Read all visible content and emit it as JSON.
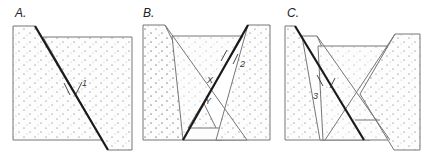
{
  "panels": [
    {
      "id": "A",
      "label": "A.",
      "slip_marker": "1",
      "markers": []
    },
    {
      "id": "B",
      "label": "B.",
      "slip_marker": "2",
      "markers": [
        "X",
        "Y"
      ]
    },
    {
      "id": "C",
      "label": "C.",
      "slip_marker": "3",
      "markers": []
    }
  ],
  "colors": {
    "fault": "#1a1a1a",
    "outline": "#777777",
    "dots": "#555555"
  }
}
